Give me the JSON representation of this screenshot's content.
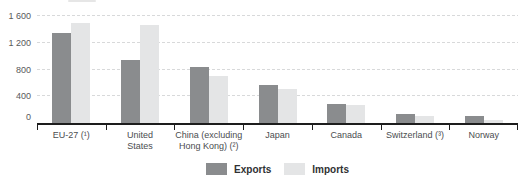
{
  "chart_data": {
    "type": "bar",
    "title": "",
    "categories": [
      "EU-27 (¹)",
      "United States",
      "China (excluding Hong Kong) (²)",
      "Japan",
      "Canada",
      "Switzerland (³)",
      "Norway"
    ],
    "category_label_lines": [
      [
        "EU-27 (¹)"
      ],
      [
        "United",
        "States"
      ],
      [
        "China (excluding",
        "Hong Kong) (²)"
      ],
      [
        "Japan"
      ],
      [
        "Canada"
      ],
      [
        "Switzerland (³)"
      ],
      [
        "Norway"
      ]
    ],
    "series": [
      {
        "name": "Exports",
        "values": [
          1340,
          940,
          840,
          570,
          280,
          140,
          100
        ]
      },
      {
        "name": "Imports",
        "values": [
          1490,
          1460,
          700,
          510,
          270,
          110,
          40
        ]
      }
    ],
    "xlabel": "",
    "ylabel": "",
    "ylim": [
      0,
      1600
    ],
    "yticks": [
      0,
      400,
      800,
      1200,
      1600
    ],
    "ytick_labels": [
      "0",
      "400",
      "800",
      "1 200",
      "1 600"
    ],
    "grid": "horizontal-dashed",
    "legend_position": "bottom-center",
    "colors": {
      "exports": "#8a8c8e",
      "imports": "#e4e5e6"
    }
  },
  "legend": {
    "exports_label": "Exports",
    "imports_label": "Imports"
  }
}
